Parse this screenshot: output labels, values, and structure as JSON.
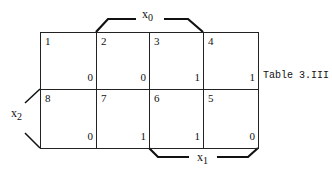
{
  "diagram": {
    "type": "karnaugh-map",
    "caption": "Table 3.III",
    "variables": {
      "top": {
        "name": "x",
        "sub": "0"
      },
      "left": {
        "name": "x",
        "sub": "2"
      },
      "bottom": {
        "name": "x",
        "sub": "1"
      }
    },
    "rows": [
      [
        {
          "index": "1",
          "value": "0"
        },
        {
          "index": "2",
          "value": "0"
        },
        {
          "index": "3",
          "value": "1"
        },
        {
          "index": "4",
          "value": "1"
        }
      ],
      [
        {
          "index": "8",
          "value": "0"
        },
        {
          "index": "7",
          "value": "1"
        },
        {
          "index": "6",
          "value": "1"
        },
        {
          "index": "5",
          "value": "0"
        }
      ]
    ]
  }
}
